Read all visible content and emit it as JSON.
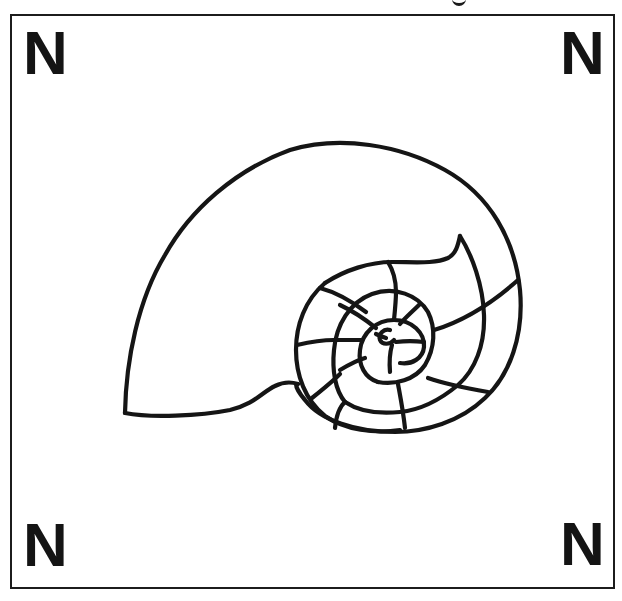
{
  "title_fragment": "g",
  "worksheet": {
    "corner_labels": {
      "top_left": "N",
      "top_right": "N",
      "bottom_left": "N",
      "bottom_right": "N"
    },
    "illustration": {
      "subject": "nautilus-shell-spiral-outline",
      "stroke_color": "#151515",
      "background_color": "#ffffff"
    },
    "frame_color": "#1c1c1c"
  }
}
